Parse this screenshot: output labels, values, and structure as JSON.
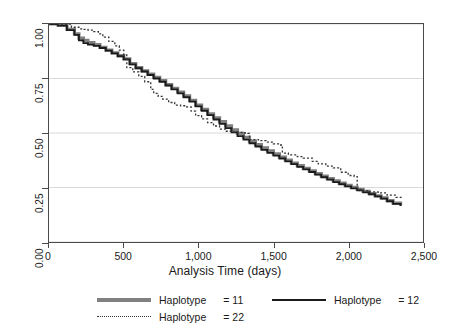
{
  "chart_data": {
    "type": "line",
    "title": "",
    "xlabel": "Analysis Time (days)",
    "ylabel": "",
    "xlim": [
      0,
      2500
    ],
    "ylim": [
      0,
      1.0
    ],
    "grid": "horizontal",
    "legend_position": "bottom",
    "x_ticks": [
      {
        "value": 0,
        "label": "0"
      },
      {
        "value": 500,
        "label": "500"
      },
      {
        "value": 1000,
        "label": "1,000"
      },
      {
        "value": 1500,
        "label": "1,500"
      },
      {
        "value": 2000,
        "label": "2,000"
      },
      {
        "value": 2500,
        "label": "2,500"
      }
    ],
    "y_ticks": [
      {
        "value": 0.0,
        "label": "0.00"
      },
      {
        "value": 0.25,
        "label": "0.25"
      },
      {
        "value": 0.5,
        "label": "0.50"
      },
      {
        "value": 0.75,
        "label": "0.75"
      },
      {
        "value": 1.0,
        "label": "1.00"
      }
    ],
    "series": [
      {
        "name": "Haplotype  = 11",
        "legend_label": "Haplotype",
        "legend_value": "= 11",
        "style": "solid-thick",
        "color": "#808080",
        "width": 3.2,
        "x": [
          0,
          60,
          120,
          170,
          200,
          230,
          260,
          300,
          340,
          380,
          420,
          460,
          500,
          540,
          580,
          620,
          660,
          700,
          740,
          780,
          820,
          860,
          900,
          940,
          980,
          1020,
          1060,
          1100,
          1140,
          1180,
          1220,
          1260,
          1300,
          1340,
          1380,
          1420,
          1460,
          1500,
          1540,
          1580,
          1620,
          1660,
          1700,
          1740,
          1780,
          1820,
          1860,
          1900,
          1940,
          1980,
          2020,
          2060,
          2100,
          2140,
          2180,
          2220,
          2260,
          2300,
          2350
        ],
        "y": [
          1.0,
          0.995,
          0.975,
          0.955,
          0.935,
          0.925,
          0.915,
          0.905,
          0.893,
          0.88,
          0.868,
          0.855,
          0.84,
          0.818,
          0.8,
          0.785,
          0.77,
          0.755,
          0.74,
          0.722,
          0.705,
          0.688,
          0.67,
          0.65,
          0.628,
          0.608,
          0.588,
          0.57,
          0.552,
          0.533,
          0.515,
          0.498,
          0.48,
          0.463,
          0.447,
          0.432,
          0.418,
          0.404,
          0.39,
          0.376,
          0.362,
          0.35,
          0.338,
          0.326,
          0.314,
          0.302,
          0.291,
          0.28,
          0.27,
          0.26,
          0.251,
          0.242,
          0.232,
          0.222,
          0.212,
          0.202,
          0.19,
          0.178,
          0.168
        ]
      },
      {
        "name": "Haplotype  = 12",
        "legend_label": "Haplotype",
        "legend_value": "= 12",
        "style": "solid-thin",
        "color": "#1a1a1a",
        "width": 1.8,
        "x": [
          0,
          60,
          120,
          170,
          200,
          230,
          260,
          300,
          340,
          380,
          420,
          460,
          500,
          540,
          580,
          620,
          660,
          700,
          740,
          780,
          820,
          860,
          900,
          940,
          980,
          1020,
          1060,
          1100,
          1140,
          1180,
          1220,
          1260,
          1300,
          1340,
          1380,
          1420,
          1460,
          1500,
          1540,
          1580,
          1620,
          1660,
          1700,
          1740,
          1780,
          1820,
          1860,
          1900,
          1940,
          1980,
          2020,
          2060,
          2100,
          2140,
          2180,
          2220,
          2260,
          2300,
          2350
        ],
        "y": [
          1.0,
          0.993,
          0.972,
          0.95,
          0.925,
          0.912,
          0.905,
          0.9,
          0.89,
          0.878,
          0.865,
          0.852,
          0.838,
          0.815,
          0.797,
          0.782,
          0.766,
          0.75,
          0.735,
          0.718,
          0.7,
          0.682,
          0.664,
          0.644,
          0.622,
          0.602,
          0.582,
          0.562,
          0.542,
          0.522,
          0.503,
          0.486,
          0.47,
          0.453,
          0.438,
          0.423,
          0.409,
          0.396,
          0.383,
          0.37,
          0.357,
          0.345,
          0.333,
          0.321,
          0.309,
          0.297,
          0.286,
          0.275,
          0.265,
          0.255,
          0.246,
          0.237,
          0.228,
          0.219,
          0.209,
          0.199,
          0.187,
          0.175,
          0.165
        ]
      },
      {
        "name": "Haplotype  = 22",
        "legend_label": "Haplotype",
        "legend_value": "= 22",
        "style": "dotted",
        "color": "#333333",
        "width": 1.3,
        "x": [
          0,
          80,
          150,
          200,
          230,
          260,
          300,
          330,
          360,
          400,
          440,
          470,
          500,
          520,
          560,
          600,
          640,
          680,
          700,
          730,
          760,
          800,
          840,
          880,
          920,
          950,
          980,
          1020,
          1060,
          1100,
          1140,
          1180,
          1220,
          1260,
          1300,
          1330,
          1340,
          1400,
          1450,
          1500,
          1540,
          1560,
          1600,
          1660,
          1700,
          1760,
          1800,
          1850,
          1900,
          1950,
          2000,
          2040,
          2060,
          2080,
          2140,
          2200,
          2260,
          2320,
          2360
        ],
        "y": [
          1.0,
          1.0,
          0.985,
          0.978,
          0.975,
          0.972,
          0.965,
          0.955,
          0.94,
          0.92,
          0.9,
          0.88,
          0.858,
          0.8,
          0.78,
          0.76,
          0.735,
          0.7,
          0.682,
          0.668,
          0.655,
          0.64,
          0.628,
          0.625,
          0.62,
          0.6,
          0.58,
          0.565,
          0.548,
          0.532,
          0.518,
          0.508,
          0.505,
          0.503,
          0.5,
          0.498,
          0.47,
          0.465,
          0.458,
          0.45,
          0.445,
          0.408,
          0.4,
          0.392,
          0.385,
          0.37,
          0.358,
          0.348,
          0.34,
          0.32,
          0.305,
          0.3,
          0.245,
          0.235,
          0.23,
          0.225,
          0.215,
          0.205,
          0.2
        ]
      }
    ]
  },
  "axes": {
    "x_title": "Analysis Time (days)"
  },
  "legend": {
    "items": [
      {
        "label": "Haplotype",
        "value": "= 11"
      },
      {
        "label": "Haplotype",
        "value": "= 22"
      },
      {
        "label": "Haplotype",
        "value": "= 12"
      }
    ]
  },
  "colors": {
    "series_11": "#808080",
    "series_12": "#1a1a1a",
    "series_22": "#333333",
    "gridline": "#d9d9d9",
    "frame": "#4a4a4a"
  }
}
